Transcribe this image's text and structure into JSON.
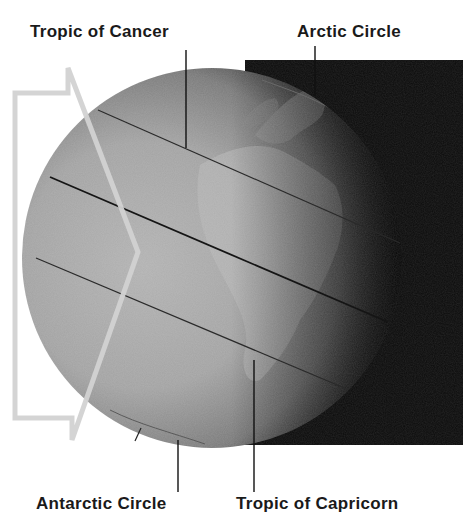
{
  "diagram": {
    "labels": {
      "tropic_of_cancer": "Tropic of Cancer",
      "arctic_circle": "Arctic Circle",
      "antarctic_circle": "Antarctic Circle",
      "tropic_of_capricorn": "Tropic of Capricorn"
    },
    "elements": {
      "sunlight_arrow": "hollow arrow pointing right (sun's rays)",
      "globe": "Earth with Africa and Europe visible",
      "night_side": "dark background behind right half of globe",
      "latitude_lines": [
        "Tropic of Cancer",
        "Equator",
        "Tropic of Capricorn",
        "Antarctic Circle",
        "Arctic Circle"
      ]
    },
    "colors": {
      "night": "#0b0b0b",
      "globe_light": "#a9a9a9",
      "globe_dark": "#3a3a3a",
      "arrow": "#d4d4d4",
      "line": "#1c1c1c",
      "text": "#1a1a1a"
    }
  }
}
